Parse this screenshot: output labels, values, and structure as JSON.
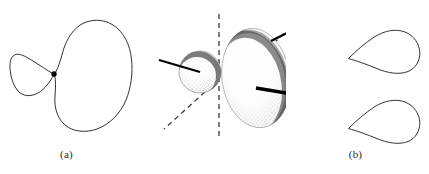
{
  "figure": {
    "panels": [
      {
        "id": "a",
        "label": "(a)",
        "caption_label": "(a)",
        "style": "line-drawing",
        "description": "two-dimensional cross-section of an sp hybrid orbital drawn as outlines: a small teardrop lobe on the left and a large kidney-shaped lobe on the right meeting at a filled node point",
        "shapes": [
          {
            "name": "small-lobe",
            "kind": "teardrop",
            "orientation": "point-right",
            "bbox": [
              10,
              52,
              46,
              44
            ]
          },
          {
            "name": "large-lobe",
            "kind": "kidney",
            "orientation": "concave-left",
            "bbox": [
              54,
              20,
              77,
              112
            ]
          },
          {
            "name": "node-dot",
            "kind": "filled-circle",
            "center": [
              54,
              74
            ],
            "radius": 2.6
          }
        ]
      },
      {
        "id": "b",
        "label": "(b)",
        "caption_label": "(b)",
        "style": "stippled-3d",
        "description": "three-dimensional stippled rendering of the same hybrid orbital showing a small sphere and a large ellipsoid, with dashed reference axes and solid bond lines radiating from the nucleus",
        "shapes": [
          {
            "name": "small-sphere",
            "kind": "sphere",
            "center": [
              200,
              72
            ],
            "radius": 21
          },
          {
            "name": "large-ellipsoid",
            "kind": "ellipsoid",
            "center": [
              256,
              78
            ],
            "rx": 34,
            "ry": 50,
            "tilt_deg": -8
          }
        ],
        "axes": [
          {
            "name": "vertical-axis",
            "from": [
              219,
              14
            ],
            "to": [
              219,
              140
            ],
            "style": "dashed"
          },
          {
            "name": "upper-right-axis",
            "from": [
              267,
              49
            ],
            "to": [
              296,
              23
            ],
            "style": "dashed"
          },
          {
            "name": "lower-left-axis",
            "from": [
              205,
              92
            ],
            "to": [
              164,
              129
            ],
            "style": "dashed"
          }
        ],
        "bonds": [
          {
            "name": "left-bond",
            "from": [
              159,
              60
            ],
            "to": [
              199,
              72
            ],
            "weight": "thin"
          },
          {
            "name": "upper-right-bond",
            "from": [
              271,
              41
            ],
            "to": [
              297,
              28
            ],
            "weight": "thin"
          },
          {
            "name": "lower-right-bond",
            "from": [
              258,
              88
            ],
            "to": [
              311,
              97
            ],
            "weight": "thick"
          }
        ]
      },
      {
        "id": "c",
        "label": "(c)",
        "caption_label": "(c)",
        "style": "line-drawing",
        "connector": "or",
        "description": "two simplified single-lobe representations of the hybrid orbital, each a teardrop pointing left, offered as alternative shorthand drawings separated by the word or",
        "shapes": [
          {
            "name": "upper-simplified-lobe",
            "kind": "teardrop",
            "orientation": "point-left",
            "bbox": [
              348,
              30,
              72,
              42
            ]
          },
          {
            "name": "lower-simplified-lobe",
            "kind": "teardrop",
            "orientation": "point-left",
            "bbox": [
              348,
              100,
              72,
              42
            ]
          }
        ]
      }
    ],
    "colors": {
      "background": "#ffffff",
      "outline": "#1c1c1c",
      "bond": "#000000",
      "axis": "#3a3a3a",
      "stipple": "#4a4a4a",
      "text": "#2b2b2b"
    }
  }
}
